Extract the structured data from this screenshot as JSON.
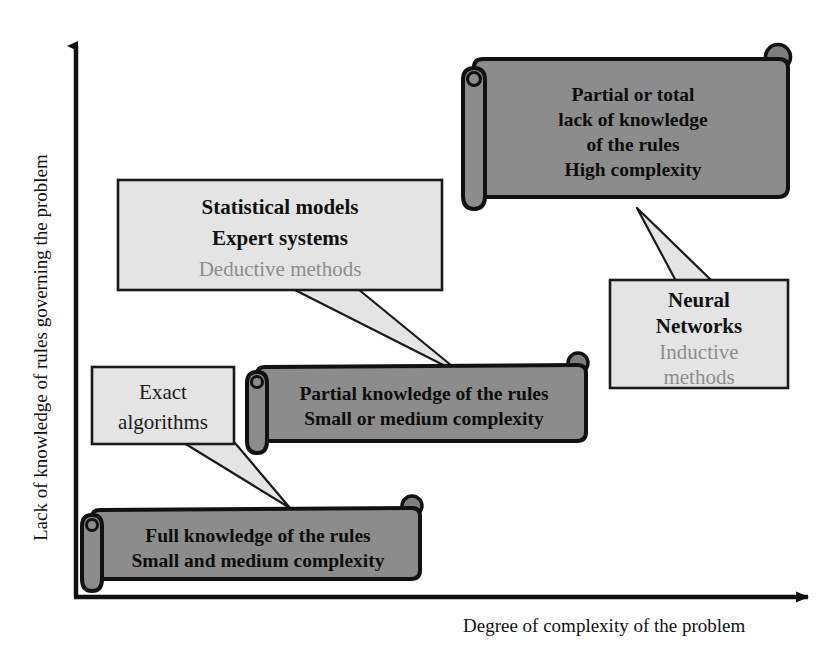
{
  "figure": {
    "kind": "scatter-quadrant-concept-diagram",
    "background": "#ffffff"
  },
  "axes": {
    "y_label": "Lack of knowledge of rules governing the problem",
    "x_label": "Degree of complexity of the problem",
    "axis_color": "#111111"
  },
  "palette": {
    "scroll_fill": "#8c8c8c",
    "scroll_curl_fill": "#7e7e7e",
    "scroll_stroke": "#111111",
    "callout_fill": "#e4e4e4",
    "callout_stroke": "#1a1a1a",
    "text_dark": "#111111",
    "text_muted": "#8d8d8d"
  },
  "scrolls": [
    {
      "id": "high-complexity-scroll",
      "lines": [
        "Partial or total",
        "lack of knowledge",
        "of the rules",
        "High complexity"
      ]
    },
    {
      "id": "partial-knowledge-scroll",
      "lines": [
        "Partial knowledge of the rules",
        "Small or medium complexity"
      ]
    },
    {
      "id": "full-knowledge-scroll",
      "lines": [
        "Full knowledge of the rules",
        "Small and medium complexity"
      ]
    }
  ],
  "callouts": [
    {
      "id": "statistical-models-callout",
      "lines": [
        {
          "text": "Statistical models",
          "style": "strong"
        },
        {
          "text": "Expert systems",
          "style": "strong"
        },
        {
          "text": "Deductive methods",
          "style": "muted"
        }
      ]
    },
    {
      "id": "neural-networks-callout",
      "lines": [
        {
          "text": "Neural",
          "style": "strong"
        },
        {
          "text": "Networks",
          "style": "strong"
        },
        {
          "text": "Inductive",
          "style": "muted"
        },
        {
          "text": "methods",
          "style": "muted"
        }
      ]
    },
    {
      "id": "exact-algorithms-callout",
      "lines": [
        {
          "text": "Exact",
          "style": "plain"
        },
        {
          "text": "algorithms",
          "style": "plain"
        }
      ]
    }
  ]
}
